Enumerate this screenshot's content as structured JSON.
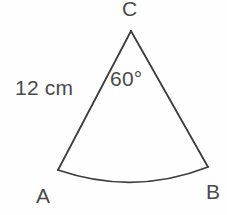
{
  "figure": {
    "kind": "circular-sector-diagram",
    "background_color": "#fefefe",
    "stroke_color": "#3c3c3c",
    "stroke_width": 1.8,
    "text_color": "#4a4a4a"
  },
  "labels": {
    "apex": "C",
    "arc_start": "A",
    "arc_end": "B",
    "radius_measure": "12 cm",
    "central_angle": "60°"
  },
  "geometry": {
    "apex_point": {
      "x": 131,
      "y": 31
    },
    "arc_start_point": {
      "x": 58,
      "y": 170
    },
    "arc_end_point": {
      "x": 208,
      "y": 167
    },
    "arc_mid_point": {
      "x": 138,
      "y": 181
    },
    "radius_px": 157,
    "central_angle_degrees": 60,
    "radius_length_value": 12,
    "radius_length_unit": "cm"
  },
  "paths": {
    "left_radius": "M 131 31 L 58 170",
    "right_radius": "M 131 31 L 208 167",
    "arc": "M 58 170 Q 134 196 208 167"
  }
}
